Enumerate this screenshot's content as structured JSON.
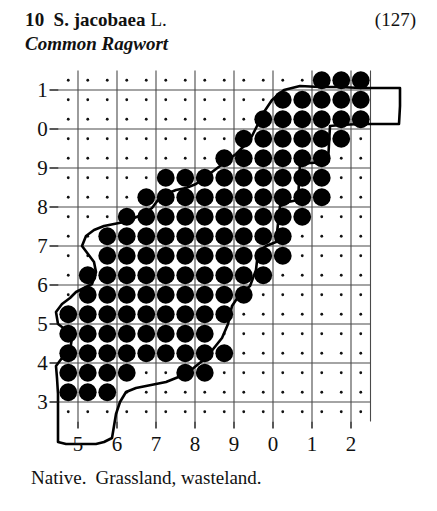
{
  "record": {
    "number": "10",
    "scientific_name": "S. jacobaea",
    "authority": "L.",
    "page_reference": "(127)",
    "common_name": "Common Ragwort",
    "status": "Native.",
    "habitat": "Grassland, wasteland."
  },
  "colors": {
    "ink": "#111111",
    "dot_fill": "#000000",
    "gridline": "#4a4a4a",
    "coastline": "#000000",
    "background": "#ffffff"
  },
  "chart_data": {
    "type": "scatter",
    "xlabel": "",
    "ylabel": "",
    "grid": true,
    "legend_position": "none",
    "x_tick_labels": [
      "5",
      "6",
      "7",
      "8",
      "9",
      "0",
      "1",
      "2"
    ],
    "y_tick_labels": [
      "1",
      "0",
      "9",
      "8",
      "7",
      "6",
      "5",
      "4",
      "3"
    ],
    "x_tick_values": [
      5,
      6,
      7,
      8,
      9,
      10,
      11,
      12
    ],
    "y_tick_values": [
      11,
      10,
      9,
      8,
      7,
      6,
      5,
      4,
      3
    ],
    "xlim": [
      4.5,
      12.5
    ],
    "ylim": [
      2.5,
      11.5
    ],
    "cell_size_km": 5,
    "grid_interval_km": 10,
    "marker": "filled-circle",
    "empty_marker": "small-dot",
    "filled_cells": [
      [
        11.25,
        11.25
      ],
      [
        11.75,
        11.25
      ],
      [
        12.25,
        11.25
      ],
      [
        10.25,
        10.75
      ],
      [
        10.75,
        10.75
      ],
      [
        11.25,
        10.75
      ],
      [
        11.75,
        10.75
      ],
      [
        12.25,
        10.75
      ],
      [
        9.75,
        10.25
      ],
      [
        10.25,
        10.25
      ],
      [
        10.75,
        10.25
      ],
      [
        11.25,
        10.25
      ],
      [
        11.75,
        10.25
      ],
      [
        12.25,
        10.25
      ],
      [
        9.25,
        9.75
      ],
      [
        9.75,
        9.75
      ],
      [
        10.25,
        9.75
      ],
      [
        10.75,
        9.75
      ],
      [
        11.25,
        9.75
      ],
      [
        11.75,
        9.75
      ],
      [
        8.75,
        9.25
      ],
      [
        9.25,
        9.25
      ],
      [
        9.75,
        9.25
      ],
      [
        10.25,
        9.25
      ],
      [
        10.75,
        9.25
      ],
      [
        11.25,
        9.25
      ],
      [
        7.25,
        8.75
      ],
      [
        7.75,
        8.75
      ],
      [
        8.25,
        8.75
      ],
      [
        8.75,
        8.75
      ],
      [
        9.25,
        8.75
      ],
      [
        9.75,
        8.75
      ],
      [
        10.25,
        8.75
      ],
      [
        10.75,
        8.75
      ],
      [
        11.25,
        8.75
      ],
      [
        6.75,
        8.25
      ],
      [
        7.25,
        8.25
      ],
      [
        7.75,
        8.25
      ],
      [
        8.25,
        8.25
      ],
      [
        8.75,
        8.25
      ],
      [
        9.25,
        8.25
      ],
      [
        9.75,
        8.25
      ],
      [
        10.25,
        8.25
      ],
      [
        10.75,
        8.25
      ],
      [
        11.25,
        8.25
      ],
      [
        6.25,
        7.75
      ],
      [
        6.75,
        7.75
      ],
      [
        7.25,
        7.75
      ],
      [
        7.75,
        7.75
      ],
      [
        8.25,
        7.75
      ],
      [
        8.75,
        7.75
      ],
      [
        9.25,
        7.75
      ],
      [
        9.75,
        7.75
      ],
      [
        10.25,
        7.75
      ],
      [
        10.75,
        7.75
      ],
      [
        5.75,
        7.25
      ],
      [
        6.25,
        7.25
      ],
      [
        6.75,
        7.25
      ],
      [
        7.25,
        7.25
      ],
      [
        7.75,
        7.25
      ],
      [
        8.25,
        7.25
      ],
      [
        8.75,
        7.25
      ],
      [
        9.25,
        7.25
      ],
      [
        9.75,
        7.25
      ],
      [
        10.25,
        7.25
      ],
      [
        5.75,
        6.75
      ],
      [
        6.25,
        6.75
      ],
      [
        6.75,
        6.75
      ],
      [
        7.25,
        6.75
      ],
      [
        7.75,
        6.75
      ],
      [
        8.25,
        6.75
      ],
      [
        8.75,
        6.75
      ],
      [
        9.25,
        6.75
      ],
      [
        9.75,
        6.75
      ],
      [
        10.25,
        6.75
      ],
      [
        5.25,
        6.25
      ],
      [
        5.75,
        6.25
      ],
      [
        6.25,
        6.25
      ],
      [
        6.75,
        6.25
      ],
      [
        7.25,
        6.25
      ],
      [
        7.75,
        6.25
      ],
      [
        8.25,
        6.25
      ],
      [
        8.75,
        6.25
      ],
      [
        9.25,
        6.25
      ],
      [
        9.75,
        6.25
      ],
      [
        5.25,
        5.75
      ],
      [
        5.75,
        5.75
      ],
      [
        6.25,
        5.75
      ],
      [
        6.75,
        5.75
      ],
      [
        7.25,
        5.75
      ],
      [
        7.75,
        5.75
      ],
      [
        8.25,
        5.75
      ],
      [
        8.75,
        5.75
      ],
      [
        9.25,
        5.75
      ],
      [
        4.75,
        5.25
      ],
      [
        5.25,
        5.25
      ],
      [
        5.75,
        5.25
      ],
      [
        6.25,
        5.25
      ],
      [
        6.75,
        5.25
      ],
      [
        7.25,
        5.25
      ],
      [
        7.75,
        5.25
      ],
      [
        8.25,
        5.25
      ],
      [
        8.75,
        5.25
      ],
      [
        4.75,
        4.75
      ],
      [
        5.25,
        4.75
      ],
      [
        5.75,
        4.75
      ],
      [
        6.25,
        4.75
      ],
      [
        6.75,
        4.75
      ],
      [
        7.25,
        4.75
      ],
      [
        7.75,
        4.75
      ],
      [
        8.25,
        4.75
      ],
      [
        4.75,
        4.25
      ],
      [
        5.25,
        4.25
      ],
      [
        5.75,
        4.25
      ],
      [
        6.25,
        4.25
      ],
      [
        6.75,
        4.25
      ],
      [
        7.25,
        4.25
      ],
      [
        7.75,
        4.25
      ],
      [
        8.25,
        4.25
      ],
      [
        8.75,
        4.25
      ],
      [
        4.75,
        3.75
      ],
      [
        5.25,
        3.75
      ],
      [
        5.75,
        3.75
      ],
      [
        6.25,
        3.75
      ],
      [
        7.75,
        3.75
      ],
      [
        8.25,
        3.75
      ],
      [
        4.75,
        3.25
      ],
      [
        5.25,
        3.25
      ],
      [
        5.75,
        3.25
      ]
    ]
  }
}
